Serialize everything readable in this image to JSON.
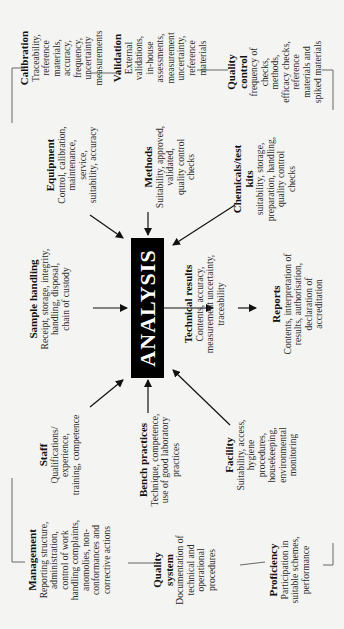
{
  "diagram": {
    "center": {
      "label": "ANALYSIS"
    },
    "blocks": {
      "management": {
        "title": "Management",
        "desc": "Reporting structure,\nadministration,\ncontrol of work\nhandling complaints,\nanomolies, non-\nconformances and\ncorrective actions"
      },
      "quality_system": {
        "title": "Quality\nsystem",
        "desc": "Documentation of\ntechnical and\noperational\nprocedures"
      },
      "proficiency": {
        "title": "Proficiency",
        "desc": "Participation in\nsuitable schemes,\nperformance"
      },
      "staff": {
        "title": "Staff",
        "desc": "Qualifications/\nexperience,\ntraining, competence"
      },
      "bench_practices": {
        "title": "Bench practices",
        "desc": "Technique, competence,\nuse of good laboratory\npractices"
      },
      "facility": {
        "title": "Facility",
        "desc": "Suitability, access,\nhygiene\nprocedures,\nhousekeeping,\nenvironmental\nmonitoring"
      },
      "sample_handling": {
        "title": "Sample handling",
        "desc": "Receipt, storage, integrity,\nhandling, disposal,\nchain of custody"
      },
      "technical_results": {
        "title": "Technical results",
        "desc": "Contents, accuracy,\nmeasurement uncertainty,\ntraceability"
      },
      "reports": {
        "title": "Reports",
        "desc": "Contents, interpretation of\nresults, authorisation,\ndeclaration of\naccreditation"
      },
      "equipment": {
        "title": "Equipment",
        "desc": "Control, calibration,\nmaintenance,\nservice,\nsuitability, accuracy"
      },
      "methods": {
        "title": "Methods",
        "desc": "Suitability, approved,\nvalidated,\nquality control\nchecks"
      },
      "chemicals": {
        "title": "Chemicals/test\nkits",
        "desc": "suitability, storage,\npreparation, handling,\nquality control\nchecks"
      },
      "calibration": {
        "title": "Calibration",
        "desc": "Traceability, reference\nmaterials, accuracy,\nfrequency, uncertainty\nmeasurements"
      },
      "validation": {
        "title": "Validation",
        "desc": "External validations,\nin-house assessments,\nmeasurement\nuncertainty,\nreference materials"
      },
      "quality_control": {
        "title": "Quality\ncontrol",
        "desc": "frequency of checks,\nmethods,\nefficacy checks,\nreference materials and\nspiked materials"
      }
    },
    "colors": {
      "background": "#f4f4f2",
      "text": "#2a2a2a",
      "center_box": "#000000",
      "center_text": "#ffffff",
      "lines": "#555555"
    }
  }
}
